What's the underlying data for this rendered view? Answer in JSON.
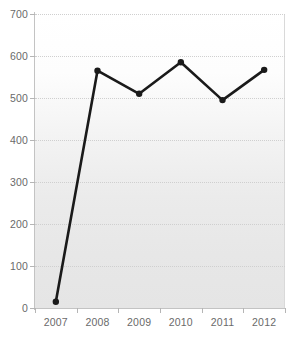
{
  "chart_data": {
    "type": "line",
    "title": "",
    "subtitle": "",
    "xlabel": "",
    "ylabel": "",
    "categories": [
      "2007",
      "2008",
      "2009",
      "2010",
      "2011",
      "2012"
    ],
    "values": [
      15,
      565,
      510,
      585,
      495,
      567
    ],
    "series": [
      {
        "name": "series-1",
        "values": [
          15,
          565,
          510,
          585,
          495,
          567
        ],
        "line_color": "#1a1a1a",
        "marker_color": "#1a1a1a",
        "marker": "circle"
      }
    ],
    "ylim": [
      0,
      700
    ],
    "yticks": [
      0,
      100,
      200,
      300,
      400,
      500,
      600,
      700
    ],
    "ytick_labels": [
      "0",
      "100",
      "200",
      "300",
      "400",
      "500",
      "600",
      "700"
    ],
    "xtick_labels": [
      "2007",
      "2008",
      "2009",
      "2010",
      "2011",
      "2012"
    ],
    "grid": true,
    "grid_axis": "y",
    "grid_style": "dotted",
    "legend": false,
    "legend_position": "none",
    "annotations": []
  },
  "style": {
    "axis_label_color": "#6a6a6a",
    "gridline_color": "#cfcfcf",
    "axis_line_color": "#c3c3c3",
    "plot_background_top": "#ffffff",
    "plot_background_bottom": "#e5e5e5",
    "page_background": "#ffffff"
  }
}
